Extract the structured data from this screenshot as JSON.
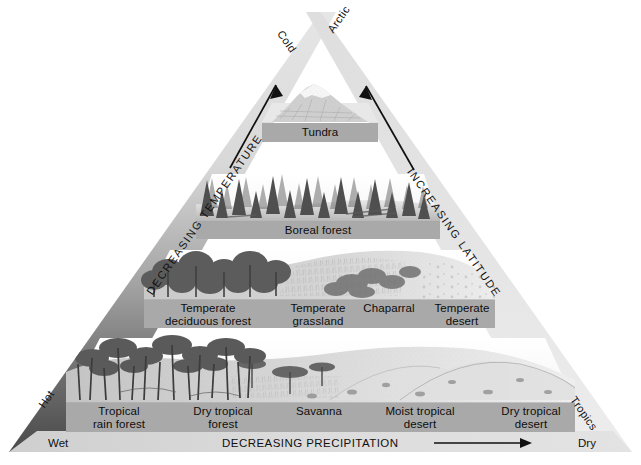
{
  "diagram": {
    "apex_labels": {
      "left": "Cold",
      "right": "Arctic"
    },
    "edge_labels": {
      "left": "DECREASING TEMPERATURE",
      "right": "INCREASING LATITUDE"
    },
    "corner_labels": {
      "bottom_left": "Hot",
      "bottom_right": "Tropics"
    },
    "baseline": {
      "left": "Wet",
      "right": "Dry",
      "caption": "DECREASING PRECIPITATION",
      "arrow": "right-arrow-icon"
    },
    "colors": {
      "label_bar": "#a9a9a9",
      "baseline_bar": "#d3d3d3",
      "edge_light": "#e2e2e2",
      "edge_dark": "#4a4a4a",
      "text": "#111111"
    },
    "bands": [
      {
        "name": "tundra-band",
        "scene": "snow-capped-mountain-scene",
        "biomes": [
          {
            "label": "Tundra"
          }
        ]
      },
      {
        "name": "boreal-band",
        "scene": "conifer-forest-scene",
        "biomes": [
          {
            "label": "Boreal forest"
          }
        ]
      },
      {
        "name": "temperate-band",
        "scene": "deciduous-grassland-desert-scene",
        "biomes": [
          {
            "label": "Temperate\ndeciduous forest"
          },
          {
            "label": "Temperate\ngrassland"
          },
          {
            "label": "Chaparral"
          },
          {
            "label": "Temperate\ndesert"
          }
        ]
      },
      {
        "name": "tropical-band",
        "scene": "rainforest-savanna-desert-scene",
        "biomes": [
          {
            "label": "Tropical\nrain forest"
          },
          {
            "label": "Dry tropical\nforest"
          },
          {
            "label": "Savanna"
          },
          {
            "label": "Moist tropical\ndesert"
          },
          {
            "label": "Dry tropical\ndesert"
          }
        ]
      }
    ]
  }
}
